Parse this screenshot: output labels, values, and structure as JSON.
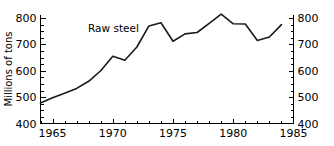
{
  "chart_data": {
    "type": "line",
    "title": "",
    "annotation": "Raw steel",
    "xlabel": "",
    "ylabel": "Millions of tons",
    "ylabel_right": "",
    "xlim": [
      1964,
      1985
    ],
    "ylim": [
      400,
      840
    ],
    "y_axis_range_labeled": [
      400,
      800
    ],
    "grid": false,
    "legend": "none",
    "x_ticks_major": [
      1965,
      1970,
      1975,
      1980,
      1985
    ],
    "x_ticks_major_labels": [
      "1965",
      "1970",
      "1975",
      "1980",
      "1985"
    ],
    "x_ticks_minor_step": 1,
    "y_ticks_major": [
      400,
      500,
      600,
      700,
      800
    ],
    "y_ticks_major_labels": [
      "400",
      "500",
      "600",
      "700",
      "800"
    ],
    "y_ticks_minor_step": 25,
    "left_axis_labels": [
      "800",
      "700",
      "600",
      "500",
      "400"
    ],
    "right_axis_labels": [
      "800",
      "700",
      "600",
      "500",
      "400"
    ],
    "series": [
      {
        "name": "Raw steel",
        "color": "#1a1a1a",
        "x": [
          1964,
          1965,
          1966,
          1967,
          1968,
          1969,
          1970,
          1971,
          1972,
          1973,
          1974,
          1975,
          1976,
          1977,
          1978,
          1979,
          1980,
          1981,
          1982,
          1983,
          1984
        ],
        "values": [
          478,
          498,
          515,
          533,
          560,
          600,
          655,
          640,
          690,
          770,
          782,
          712,
          740,
          745,
          780,
          815,
          778,
          777,
          715,
          728,
          775
        ]
      }
    ]
  },
  "axis": {
    "y_title": "Millions of tons"
  }
}
